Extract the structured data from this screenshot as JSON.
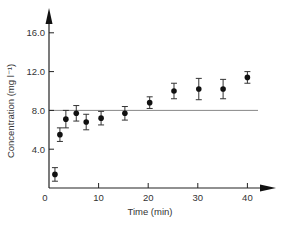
{
  "chart_data": {
    "type": "scatter",
    "title": "",
    "xlabel": "Time (min)",
    "ylabel": "Concentration (mg l⁻¹)",
    "xlim": [
      0,
      44
    ],
    "ylim": [
      0,
      17.5
    ],
    "x_ticks": [
      0,
      10,
      20,
      30,
      40
    ],
    "x_tick_labels": [
      "0",
      "10",
      "20",
      "30",
      "40"
    ],
    "y_ticks": [
      4.0,
      8.0,
      12.0,
      16.0
    ],
    "y_tick_labels": [
      "4.0",
      "8.0",
      "12.0",
      "16.0"
    ],
    "grid": false,
    "legend": null,
    "series": [
      {
        "name": "Concentration",
        "x": [
          1.2,
          2.2,
          3.4,
          5.5,
          7.5,
          10.5,
          15.3,
          20.3,
          25.2,
          30.2,
          35.1,
          40.0
        ],
        "values": [
          1.4,
          5.5,
          7.1,
          7.7,
          6.8,
          7.2,
          7.7,
          8.8,
          10.0,
          10.2,
          10.2,
          11.4
        ],
        "error": [
          0.7,
          0.7,
          0.9,
          0.8,
          0.8,
          0.7,
          0.7,
          0.6,
          0.8,
          1.1,
          1.0,
          0.6
        ]
      }
    ],
    "reference_line": {
      "y": 8.0,
      "orientation": "horizontal"
    }
  }
}
